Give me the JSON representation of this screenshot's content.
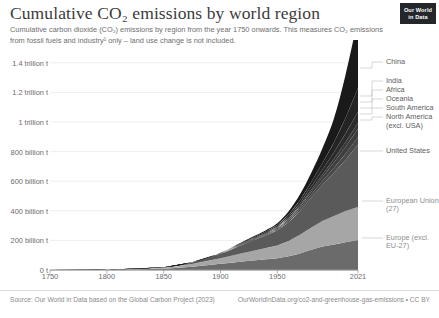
{
  "header": {
    "title": "Cumulative CO₂ emissions by world region",
    "subtitle_line1": "Cumulative carbon dioxide (CO₂) emissions by region from the year 1750 onwards. This measures CO₂ emissions",
    "subtitle_line2": "from fossil fuels and industry¹ only – land use change is not included.",
    "logo_line1": "Our World",
    "logo_line2": "in Data"
  },
  "footer": {
    "source": "Source: Our World in Data based on the Global Carbon Project (2023)",
    "attribution": "OurWorldInData.org/co2-and-greenhouse-gas-emissions • CC BY"
  },
  "chart_data": {
    "type": "area",
    "stacked": true,
    "title": "Cumulative CO₂ emissions by world region",
    "xlabel": "",
    "ylabel": "",
    "xlim": [
      1750,
      2021
    ],
    "ylim": [
      0,
      1500000000000
    ],
    "grid": true,
    "legend_position": "right-inline",
    "x_ticks": [
      1750,
      1800,
      1850,
      1900,
      1950,
      2021
    ],
    "x_tick_labels": [
      "1750",
      "1800",
      "1850",
      "1900",
      "1950",
      "2021"
    ],
    "y_ticks": [
      0,
      200000000000,
      400000000000,
      600000000000,
      800000000000,
      1000000000000,
      1200000000000,
      1400000000000
    ],
    "y_tick_labels": [
      "0 t",
      "200 billion t",
      "400 billion t",
      "600 billion t",
      "800 billion t",
      "1 trillion t",
      "1.2 trillion t",
      "1.4 trillion t"
    ],
    "x": [
      1750,
      1800,
      1850,
      1875,
      1900,
      1920,
      1940,
      1950,
      1960,
      1970,
      1980,
      1990,
      2000,
      2010,
      2021
    ],
    "units": "tonnes CO₂",
    "series": [
      {
        "name": "Europe (excl. EU-27)",
        "color": "#6b6b6b",
        "values": [
          0,
          1000000000,
          9000000000,
          22000000000,
          42000000000,
          58000000000,
          72000000000,
          80000000000,
          93000000000,
          112000000000,
          136000000000,
          158000000000,
          172000000000,
          188000000000,
          202000000000
        ]
      },
      {
        "name": "European Union (27)",
        "color": "#a6a6a6",
        "values": [
          0,
          1000000000,
          7000000000,
          18000000000,
          38000000000,
          57000000000,
          76000000000,
          86000000000,
          103000000000,
          126000000000,
          152000000000,
          175000000000,
          193000000000,
          211000000000,
          224000000000
        ]
      },
      {
        "name": "United States",
        "color": "#5a5a5a",
        "values": [
          0,
          200000000,
          3000000000,
          11000000000,
          29000000000,
          58000000000,
          85000000000,
          102000000000,
          128000000000,
          163000000000,
          203000000000,
          245000000000,
          294000000000,
          345000000000,
          422000000000
        ]
      },
      {
        "name": "North America (excl. USA)",
        "color": "#4a4a4a",
        "values": [
          0,
          0,
          100000000,
          400000000,
          1500000000,
          3500000000,
          6000000000,
          8000000000,
          11000000000,
          15000000000,
          21000000000,
          27000000000,
          34000000000,
          42000000000,
          50000000000
        ]
      },
      {
        "name": "South America",
        "color": "#3e3e3e",
        "values": [
          0,
          0,
          100000000,
          300000000,
          1000000000,
          2500000000,
          4500000000,
          6000000000,
          9000000000,
          13000000000,
          19000000000,
          26000000000,
          35000000000,
          46000000000,
          58000000000
        ]
      },
      {
        "name": "Oceania",
        "color": "#353535",
        "values": [
          0,
          0,
          0,
          200000000,
          800000000,
          2000000000,
          3500000000,
          4500000000,
          6500000000,
          9000000000,
          13000000000,
          18000000000,
          24000000000,
          31000000000,
          38000000000
        ]
      },
      {
        "name": "Africa",
        "color": "#2c2c2c",
        "values": [
          0,
          0,
          0,
          200000000,
          900000000,
          2500000000,
          5000000000,
          7000000000,
          10000000000,
          15000000000,
          23000000000,
          33000000000,
          45000000000,
          59000000000,
          76000000000
        ]
      },
      {
        "name": "India",
        "color": "#242424",
        "values": [
          0,
          0,
          100000000,
          400000000,
          1800000000,
          4500000000,
          8000000000,
          10000000000,
          14000000000,
          20000000000,
          29000000000,
          44000000000,
          68000000000,
          105000000000,
          160000000000
        ]
      },
      {
        "name": "China",
        "color": "#1a1a1a",
        "values": [
          0,
          0,
          200000000,
          600000000,
          2000000000,
          5000000000,
          9000000000,
          12000000000,
          22000000000,
          38000000000,
          62000000000,
          101000000000,
          163000000000,
          291000000000,
          470000000000
        ]
      }
    ],
    "annotations": [
      {
        "label": "China",
        "series": "China"
      },
      {
        "label": "India",
        "series": "India"
      },
      {
        "label": "Africa",
        "series": "Africa"
      },
      {
        "label": "Oceania",
        "series": "Oceania"
      },
      {
        "label": "South America",
        "series": "South America"
      },
      {
        "label": "North America",
        "series": "North America (excl. USA)"
      },
      {
        "label": "(excl. USA)",
        "series": "North America (excl. USA)"
      },
      {
        "label": "United States",
        "series": "United States"
      },
      {
        "label": "European Union",
        "series": "European Union (27)"
      },
      {
        "label": "(27)",
        "series": "European Union (27)"
      },
      {
        "label": "Europe (excl.",
        "series": "Europe (excl. EU-27)"
      },
      {
        "label": "EU-27)",
        "series": "Europe (excl. EU-27)"
      }
    ]
  },
  "legend_labels": [
    {
      "id": "china",
      "text": "China",
      "x": 386,
      "y": 22,
      "light": false
    },
    {
      "id": "india",
      "text": "India",
      "x": 386,
      "y": 41,
      "light": false
    },
    {
      "id": "africa",
      "text": "Africa",
      "x": 386,
      "y": 50,
      "light": false
    },
    {
      "id": "oceania",
      "text": "Oceania",
      "x": 386,
      "y": 59,
      "light": false
    },
    {
      "id": "south-america",
      "text": "South America",
      "x": 386,
      "y": 68,
      "light": false
    },
    {
      "id": "north-america",
      "text": "North America",
      "x": 386,
      "y": 77,
      "light": false
    },
    {
      "id": "north-america-2",
      "text": "(excl. USA)",
      "x": 386,
      "y": 86,
      "light": false
    },
    {
      "id": "united-states",
      "text": "United States",
      "x": 386,
      "y": 111,
      "light": false
    },
    {
      "id": "european-union",
      "text": "European Union",
      "x": 386,
      "y": 161,
      "light": true
    },
    {
      "id": "european-union-2",
      "text": "(27)",
      "x": 386,
      "y": 169,
      "light": true
    },
    {
      "id": "europe-excl",
      "text": "Europe (excl.",
      "x": 386,
      "y": 198,
      "light": true
    },
    {
      "id": "europe-excl-2",
      "text": "EU-27)",
      "x": 386,
      "y": 206,
      "light": true
    }
  ]
}
